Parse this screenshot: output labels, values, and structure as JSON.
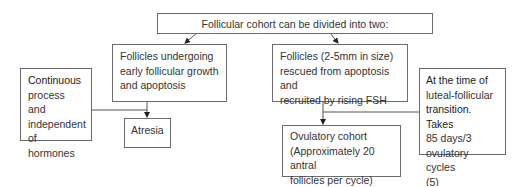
{
  "diagram": {
    "root": {
      "text": "Follicular cohort can be divided into two:"
    },
    "branch_left": {
      "lines": [
        "Follicles undergoing",
        "early follicular growth",
        "and apoptosis"
      ]
    },
    "branch_right": {
      "lines": [
        "Follicles (2-5mm in size)",
        "rescued from apoptosis and",
        "recruited by rising FSH"
      ]
    },
    "note_left": {
      "lines": [
        "Continuous",
        "process and",
        "independent",
        "of hormones"
      ]
    },
    "note_right": {
      "lines": [
        "At the time of",
        "luteal-follicular",
        "transition. Takes",
        "85 days/3",
        "ovulatory cycles",
        "(5)"
      ]
    },
    "outcome_left": {
      "text": "Atresia"
    },
    "outcome_right": {
      "lines": [
        "Ovulatory cohort",
        "(Approximately 20 antral",
        "follicles per cycle)"
      ]
    },
    "colors": {
      "border": "#6b6b6b",
      "arrow": "#222222",
      "text": "#333333"
    }
  }
}
